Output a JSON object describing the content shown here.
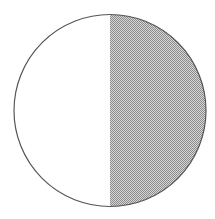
{
  "diagram": {
    "type": "fraction-circle",
    "parts_total": 2,
    "parts_shaded": 1,
    "fraction_shaded": "1/2",
    "shaded_side": "right",
    "colors": {
      "background": "#ffffff",
      "outline": "#555555",
      "unshaded_fill": "#ffffff",
      "shade_dark": "#8c8c8c",
      "shade_light": "#d6d6d6"
    },
    "geometry": {
      "cx": 110,
      "cy": 110.5,
      "r": 96
    }
  }
}
